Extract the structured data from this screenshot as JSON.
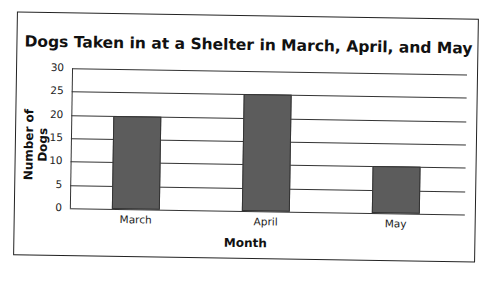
{
  "chart_data": {
    "type": "bar",
    "title": "Dogs Taken in at a Shelter in March, April, and May",
    "xlabel": "Month",
    "ylabel": "Number of Dogs",
    "categories": [
      "March",
      "April",
      "May"
    ],
    "values": [
      20,
      25,
      10
    ],
    "ylim": [
      0,
      30
    ],
    "yticks": [
      "0",
      "5",
      "10",
      "15",
      "20",
      "25",
      "30"
    ],
    "grid": true,
    "legend": false,
    "bar_color": "#5c5c5c"
  }
}
